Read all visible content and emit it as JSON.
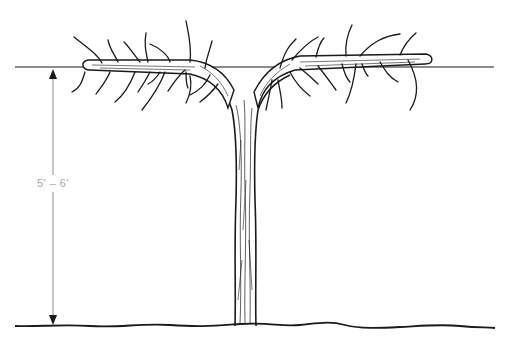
{
  "diagram": {
    "measurement": {
      "label": "5′ – 6′",
      "meaning": "height from ground to trellis wire"
    },
    "elements": {
      "trellis_wire": {
        "y": 67,
        "x_start": 15,
        "x_end": 494
      },
      "ground_line": {
        "y": 326,
        "x_start": 15,
        "x_end": 495
      },
      "dimension_arrow": {
        "x": 53,
        "y_top": 67,
        "y_bottom": 326
      },
      "trunk": {
        "x_left": 234,
        "x_right": 256,
        "y_top": 110,
        "y_bottom": 326
      },
      "cordon_left": {
        "x_start": 80,
        "x_end": 230
      },
      "cordon_right": {
        "x_start": 262,
        "x_end": 430
      }
    },
    "colors": {
      "ink": "#1a1a1a",
      "dimension": "#8c8c8c",
      "label": "#a8a8a8",
      "background": "#ffffff"
    }
  }
}
